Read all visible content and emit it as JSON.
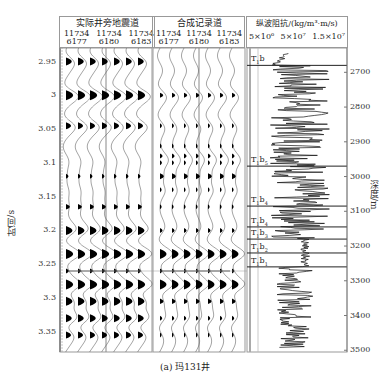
{
  "chart_data": {
    "type": "seismic-well-tie",
    "title": "(a) 玛131井",
    "panels": [
      {
        "name": "实际井旁地震道",
        "traces": [
          {
            "line": "11734",
            "cdp": "6177"
          },
          {
            "line": "11734",
            "cdp": "6180"
          },
          {
            "line": "11734",
            "cdp": "6183"
          }
        ],
        "traces_per_group": 3,
        "wiggle_fill_color": "#000000"
      },
      {
        "name": "合成记录道",
        "traces": [
          {
            "line": "11734",
            "cdp": "6177"
          },
          {
            "line": "11734",
            "cdp": "6180"
          },
          {
            "line": "11734",
            "cdp": "6183"
          }
        ],
        "traces_per_group": 3,
        "wiggle_fill_color": "#000000"
      },
      {
        "name": "纵波阻抗/(kg/m³·m/s)",
        "type": "line",
        "x_ticks": [
          "5×10⁶",
          "5×10⁷",
          "1.5×10⁷"
        ]
      }
    ],
    "ylabel_left": "时间/s",
    "yticks_left": [
      "2.95",
      "3",
      "3.05",
      "3.1",
      "3.15",
      "3.2",
      "3.25",
      "3.3",
      "3.35"
    ],
    "ylim_left": [
      2.93,
      3.38
    ],
    "ylabel_right": "深度/m",
    "yticks_right": [
      "2700",
      "2800",
      "2900",
      "3000",
      "3100",
      "3200",
      "3300",
      "3400",
      "3500"
    ],
    "ylim_right": [
      2630,
      3505
    ],
    "horizons": [
      {
        "label": "T",
        "sub1": "1",
        "name": "b",
        "sub2": "",
        "depth": 2680
      },
      {
        "label": "T",
        "sub1": "1",
        "name": "b",
        "sub2": "5",
        "depth": 2970
      },
      {
        "label": "T",
        "sub1": "1",
        "name": "b",
        "sub2": "4",
        "depth": 3085
      },
      {
        "label": "T",
        "sub1": "1",
        "name": "b",
        "sub2": "4",
        "depth": 3145
      },
      {
        "label": "T",
        "sub1": "1",
        "name": "b",
        "sub2": "3",
        "depth": 3180
      },
      {
        "label": "T",
        "sub1": "1",
        "name": "b",
        "sub2": "2",
        "depth": 3220
      },
      {
        "label": "T",
        "sub1": "1",
        "name": "b",
        "sub2": "1",
        "depth": 3260
      }
    ],
    "tie_line_time": 3.265
  },
  "labels": {
    "panel1_title": "实际井旁地震道",
    "panel2_title": "合成记录道",
    "panel3_title": "纵波阻抗/(kg/m³·m/s)",
    "line_code": "11734",
    "cdp1": "6177",
    "cdp2": "6180",
    "cdp3": "6183",
    "imp_tick1": "5×10⁶",
    "imp_tick2": "5×10⁷",
    "imp_tick3": "1.5×10⁷",
    "ylabel_left": "时间/s",
    "ylabel_right": "深度/m",
    "caption": "(a) 玛131井"
  }
}
